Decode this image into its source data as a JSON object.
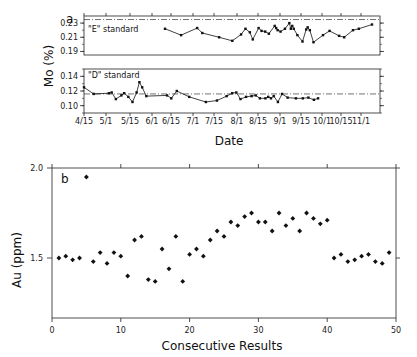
{
  "chart_data": [
    {
      "type": "line",
      "panel": "a",
      "title": "",
      "xlabel": "Date",
      "ylabel": "Mo (%)",
      "x_tick_labels": [
        "4/15",
        "5/1",
        "5/15",
        "6/1",
        "6/15",
        "7/1",
        "7/15",
        "8/1",
        "8/15",
        "9/1",
        "9/15",
        "10/1",
        "10/15",
        "11/1"
      ],
      "subplots": [
        {
          "name": "\"E\" standard",
          "ylim": [
            0.185,
            0.24
          ],
          "y_ticks": [
            "0.19",
            "0.21",
            "0.23"
          ],
          "reference_line": 0.235,
          "x_px": [
            187,
            209,
            231,
            238,
            261,
            279,
            291,
            297,
            303,
            307,
            315,
            319,
            324,
            329,
            337,
            339,
            341,
            345,
            351,
            357,
            359,
            361,
            363,
            368,
            375,
            380,
            382,
            385,
            390,
            403,
            412,
            425,
            432,
            444,
            452,
            470
          ],
          "values": [
            0.222,
            0.213,
            0.223,
            0.216,
            0.21,
            0.205,
            0.214,
            0.222,
            0.217,
            0.207,
            0.223,
            0.219,
            0.218,
            0.215,
            0.226,
            0.223,
            0.22,
            0.218,
            0.222,
            0.23,
            0.222,
            0.226,
            0.222,
            0.213,
            0.204,
            0.221,
            0.224,
            0.22,
            0.203,
            0.213,
            0.219,
            0.212,
            0.21,
            0.22,
            0.222,
            0.228
          ]
        },
        {
          "name": "\"D\" standard",
          "ylim": [
            0.09,
            0.15
          ],
          "y_ticks": [
            "0.10",
            "0.12",
            "0.14"
          ],
          "reference_line": 0.116,
          "dates_approx": [
            "4/15",
            "4/22",
            "5/3",
            "5/5",
            "5/8",
            "5/12",
            "5/14",
            "5/17",
            "5/20",
            "5/23",
            "5/25",
            "5/27",
            "5/30",
            "6/14",
            "6/17",
            "6/21",
            "6/30",
            "7/12",
            "7/20",
            "7/27",
            "7/31",
            "8/3",
            "8/6",
            "8/10",
            "8/14",
            "8/17",
            "8/20",
            "8/24",
            "8/26",
            "8/28",
            "8/30",
            "9/2",
            "9/5",
            "9/9",
            "9/15",
            "9/20",
            "9/24",
            "9/28",
            "10/1"
          ],
          "values": [
            0.125,
            0.116,
            0.117,
            0.118,
            0.109,
            0.114,
            0.117,
            0.112,
            0.105,
            0.118,
            0.132,
            0.125,
            0.113,
            0.114,
            0.11,
            0.12,
            0.112,
            0.105,
            0.107,
            0.113,
            0.117,
            0.118,
            0.109,
            0.112,
            0.113,
            0.114,
            0.11,
            0.11,
            0.112,
            0.11,
            0.113,
            0.105,
            0.116,
            0.111,
            0.11,
            0.11,
            0.111,
            0.108,
            0.11
          ]
        }
      ],
      "grid": false
    },
    {
      "type": "scatter",
      "panel": "b",
      "title": "",
      "xlabel": "Consecutive Results",
      "ylabel": "Au (ppm)",
      "xlim": [
        0,
        50
      ],
      "ylim": [
        1.167,
        2.0
      ],
      "x_ticks": [
        "0",
        "10",
        "20",
        "30",
        "40",
        "50"
      ],
      "y_ticks": [
        "1.5",
        "2.0"
      ],
      "x": [
        1,
        2,
        3,
        4,
        5,
        6,
        7,
        8,
        9,
        10,
        11,
        12,
        13,
        14,
        15,
        16,
        17,
        18,
        19,
        20,
        21,
        22,
        23,
        24,
        25,
        26,
        27,
        28,
        29,
        30,
        31,
        32,
        33,
        34,
        35,
        36,
        37,
        38,
        39,
        40,
        41,
        42,
        43,
        44,
        45,
        46,
        47,
        48,
        49
      ],
      "values": [
        1.5,
        1.51,
        1.49,
        1.5,
        1.95,
        1.48,
        1.53,
        1.47,
        1.53,
        1.51,
        1.4,
        1.6,
        1.62,
        1.38,
        1.37,
        1.55,
        1.44,
        1.62,
        1.37,
        1.52,
        1.55,
        1.51,
        1.6,
        1.65,
        1.62,
        1.7,
        1.68,
        1.73,
        1.75,
        1.7,
        1.7,
        1.65,
        1.75,
        1.68,
        1.72,
        1.65,
        1.75,
        1.72,
        1.69,
        1.71,
        1.5,
        1.52,
        1.48,
        1.49,
        1.51,
        1.52,
        1.48,
        1.47,
        1.53
      ],
      "grid": false
    }
  ],
  "labels": {
    "panel_a": "a",
    "panel_b": "b",
    "mo_ylabel": "Mo (%)",
    "au_ylabel": "Au (ppm)",
    "date_xlabel": "Date",
    "results_xlabel": "Consecutive Results",
    "e_standard": "\"E\" standard",
    "d_standard": "\"D\" standard"
  }
}
